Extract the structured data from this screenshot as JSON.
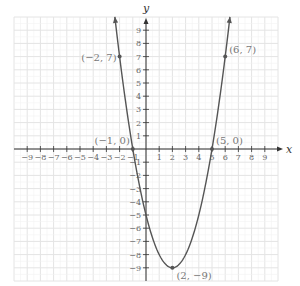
{
  "chart_data": {
    "type": "line",
    "title": "",
    "function": "y = x^2 - 4x - 5",
    "xlabel": "x",
    "ylabel": "y",
    "xlim": [
      -10,
      10
    ],
    "ylim": [
      -10,
      10
    ],
    "grid": true,
    "x_ticks": [
      -9,
      -8,
      -7,
      -6,
      -5,
      -4,
      -3,
      -2,
      -1,
      1,
      2,
      3,
      4,
      5,
      6,
      7,
      8,
      9
    ],
    "y_ticks": [
      -9,
      -8,
      -7,
      -6,
      -5,
      -4,
      -3,
      -2,
      -1,
      1,
      2,
      3,
      4,
      5,
      6,
      7,
      8,
      9
    ],
    "x_tick_labels": [
      "−9",
      "−8",
      "−7",
      "−6",
      "−5",
      "−4",
      "−3",
      "−2",
      "−1",
      "1",
      "2",
      "3",
      "4",
      "5",
      "6",
      "7",
      "8",
      "9"
    ],
    "y_tick_labels": [
      "−9",
      "−8",
      "−7",
      "−6",
      "−5",
      "−4",
      "−3",
      "−2",
      "−1",
      "1",
      "2",
      "3",
      "4",
      "5",
      "6",
      "7",
      "8",
      "9"
    ],
    "series": [
      {
        "name": "parabola",
        "x_range": [
          -2.36,
          6.36
        ],
        "points": [
          {
            "x": -2,
            "y": 7,
            "label": "(−2, 7)"
          },
          {
            "x": -1,
            "y": 0,
            "label": "(−1, 0)"
          },
          {
            "x": 2,
            "y": -9,
            "label": "(2, −9)"
          },
          {
            "x": 5,
            "y": 0,
            "label": "(5, 0)"
          },
          {
            "x": 6,
            "y": 7,
            "label": "(6, 7)"
          }
        ]
      }
    ],
    "annotations": [
      "(−2, 7)",
      "(−1, 0)",
      "(2, −9)",
      "(5, 0)",
      "(6, 7)"
    ]
  },
  "colors": {
    "grid": "#e4e4e4",
    "axis": "#333333",
    "curve": "#555555",
    "label": "#777777"
  },
  "layout": {
    "origin_px": [
      146,
      149
    ],
    "unit_px": 13.2
  }
}
